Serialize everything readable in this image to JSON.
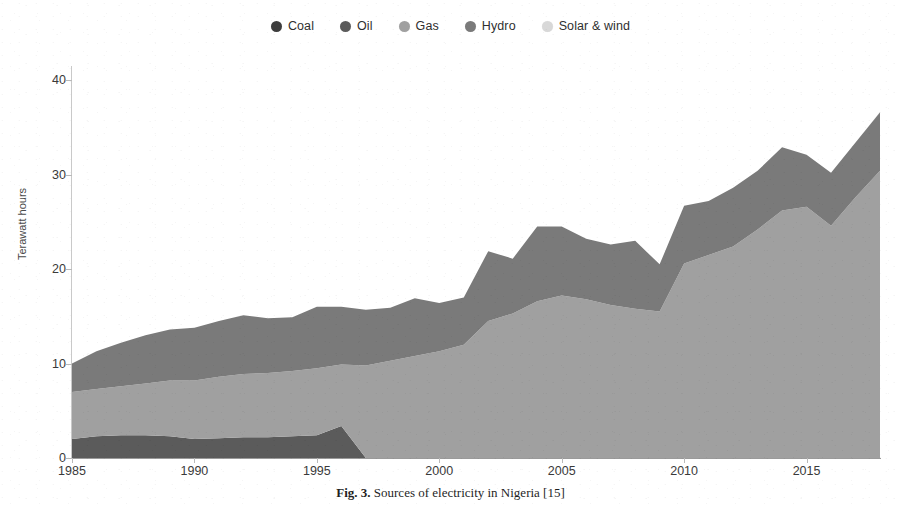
{
  "figure": {
    "caption_label": "Fig. 3.",
    "caption_text": "Sources of electricity in Nigeria [15]"
  },
  "legend": {
    "position": "top-center",
    "items": [
      {
        "label": "Coal",
        "color": "#3d3d3d",
        "icon": "legend-dot-icon"
      },
      {
        "label": "Oil",
        "color": "#5b5b5b",
        "icon": "legend-dot-icon"
      },
      {
        "label": "Gas",
        "color": "#a0a0a0",
        "icon": "legend-dot-icon"
      },
      {
        "label": "Hydro",
        "color": "#7a7a7a",
        "icon": "legend-dot-icon"
      },
      {
        "label": "Solar & wind",
        "color": "#d8d8d8",
        "icon": "legend-dot-icon"
      }
    ]
  },
  "axes": {
    "ylabel": "Terawatt hours",
    "xlabel": "",
    "yticks": [
      "0",
      "10",
      "20",
      "30",
      "40"
    ],
    "ytick_values": [
      0,
      10,
      20,
      30,
      40
    ],
    "xticks": [
      "1985",
      "1990",
      "1995",
      "2000",
      "2005",
      "2010",
      "2015"
    ],
    "xtick_values": [
      1985,
      1990,
      1995,
      2000,
      2005,
      2010,
      2015
    ],
    "ylim": [
      0,
      41.5
    ],
    "xlim": [
      1985,
      2018
    ],
    "grid": false
  },
  "chart_data": {
    "type": "area",
    "stacked": true,
    "title": "",
    "subtitle": "",
    "xlabel": "",
    "ylabel": "Terawatt hours",
    "ylim": [
      0,
      41.5
    ],
    "xlim": [
      1985,
      2018
    ],
    "grid": false,
    "legend_position": "top-center",
    "x": [
      1985,
      1986,
      1987,
      1988,
      1989,
      1990,
      1991,
      1992,
      1993,
      1994,
      1995,
      1996,
      1997,
      1998,
      1999,
      2000,
      2001,
      2002,
      2003,
      2004,
      2005,
      2006,
      2007,
      2008,
      2009,
      2010,
      2011,
      2012,
      2013,
      2014,
      2015,
      2016,
      2017,
      2018
    ],
    "series": [
      {
        "name": "Coal",
        "color": "#3d3d3d",
        "values": [
          0,
          0,
          0,
          0,
          0,
          0,
          0,
          0,
          0,
          0,
          0,
          0,
          0,
          0,
          0,
          0,
          0,
          0,
          0,
          0,
          0,
          0,
          0,
          0,
          0,
          0,
          0,
          0,
          0,
          0,
          0,
          0,
          0,
          0
        ]
      },
      {
        "name": "Oil",
        "color": "#5b5b5b",
        "values": [
          2.0,
          2.3,
          2.4,
          2.4,
          2.3,
          2.0,
          2.1,
          2.2,
          2.2,
          2.3,
          2.4,
          3.4,
          0.0,
          0.0,
          0.0,
          0.0,
          0.0,
          0.0,
          0.0,
          0.0,
          0.0,
          0.0,
          0.0,
          0.0,
          0.0,
          0.0,
          0.0,
          0.0,
          0.0,
          0.0,
          0.0,
          0.0,
          0.0,
          0.0
        ]
      },
      {
        "name": "Gas",
        "color": "#a0a0a0",
        "values": [
          5.0,
          5.0,
          5.2,
          5.5,
          5.9,
          6.2,
          6.5,
          6.7,
          6.8,
          6.9,
          7.1,
          6.5,
          9.8,
          10.3,
          10.8,
          11.3,
          12.0,
          14.5,
          15.3,
          16.6,
          17.2,
          16.8,
          16.2,
          15.8,
          15.5,
          20.6,
          21.5,
          22.4,
          24.2,
          26.2,
          26.6,
          24.6,
          27.6,
          30.4
        ]
      },
      {
        "name": "Hydro",
        "color": "#7a7a7a",
        "values": [
          3.0,
          4.0,
          4.6,
          5.1,
          5.4,
          5.6,
          5.9,
          6.2,
          5.8,
          5.7,
          6.5,
          6.1,
          5.9,
          5.6,
          6.1,
          5.1,
          5.0,
          7.4,
          5.8,
          7.9,
          7.3,
          6.4,
          6.4,
          7.2,
          5.0,
          6.1,
          5.7,
          6.2,
          6.2,
          6.7,
          5.5,
          5.6,
          5.8,
          6.2
        ]
      },
      {
        "name": "Solar & wind",
        "color": "#d8d8d8",
        "values": [
          0,
          0,
          0,
          0,
          0,
          0,
          0,
          0,
          0,
          0,
          0,
          0,
          0,
          0,
          0,
          0,
          0,
          0,
          0,
          0,
          0,
          0,
          0,
          0,
          0,
          0,
          0,
          0,
          0,
          0,
          0,
          0,
          0,
          0.03
        ]
      }
    ],
    "totals": [
      10.0,
      11.3,
      12.2,
      13.0,
      13.6,
      13.8,
      14.5,
      15.1,
      14.8,
      14.9,
      16.0,
      16.0,
      15.7,
      15.9,
      16.9,
      16.4,
      17.0,
      21.9,
      21.1,
      24.5,
      24.5,
      23.2,
      22.6,
      23.0,
      20.5,
      26.7,
      27.2,
      28.6,
      30.4,
      32.9,
      32.1,
      30.2,
      33.4,
      36.6
    ]
  }
}
